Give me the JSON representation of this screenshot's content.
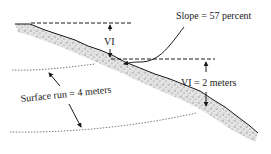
{
  "diagram": {
    "labels": {
      "slope": "Slope = 57 percent",
      "vi_upper": "VI",
      "vi_lower": "VI = 2 meters",
      "surface_run": "Surface run = 4 meters"
    },
    "colors": {
      "ink": "#1a1a1a",
      "terrain_fill": "#d6d6d6",
      "terrain_texture": "#8a8a8a",
      "background": "#ffffff"
    }
  }
}
